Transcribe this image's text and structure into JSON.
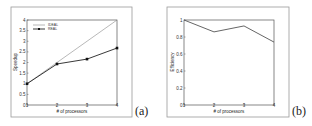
{
  "chart_data": [
    {
      "type": "line",
      "panel_label": "(a)",
      "title": "",
      "xlabel": "# of processors",
      "ylabel": "Speedup",
      "x": [
        1,
        2,
        3,
        4
      ],
      "xticks": [
        "1",
        "2",
        "3",
        "4"
      ],
      "yticks": [
        "0",
        "0.5",
        "1",
        "1.5",
        "2",
        "2.5",
        "3",
        "3.5",
        "4"
      ],
      "ylim": [
        0,
        4
      ],
      "xlim": [
        1,
        4
      ],
      "grid": false,
      "legend_position": "upper left",
      "series": [
        {
          "name": "IDEAL",
          "values": [
            1,
            2,
            3,
            4
          ],
          "marker": "none"
        },
        {
          "name": "REAL",
          "values": [
            1.0,
            1.93,
            2.16,
            2.68
          ],
          "marker": "square"
        }
      ]
    },
    {
      "type": "line",
      "panel_label": "(b)",
      "title": "",
      "xlabel": "# of processors",
      "ylabel": "Efficiency",
      "x": [
        1,
        2,
        3,
        4
      ],
      "xticks": [
        "1",
        "2",
        "3",
        "4"
      ],
      "yticks": [
        "0",
        "0.2",
        "0.4",
        "0.6",
        "0.8",
        "1"
      ],
      "ylim": [
        0,
        1
      ],
      "xlim": [
        1,
        4
      ],
      "grid": false,
      "series": [
        {
          "name": "Efficiency",
          "values": [
            1.0,
            0.86,
            0.93,
            0.74
          ],
          "marker": "none"
        }
      ]
    }
  ],
  "colors": {
    "frame": "#9a9a9a",
    "axis": "#555555",
    "ideal_line": "#888888",
    "real_line": "#222222",
    "efficiency_line": "#555555"
  }
}
